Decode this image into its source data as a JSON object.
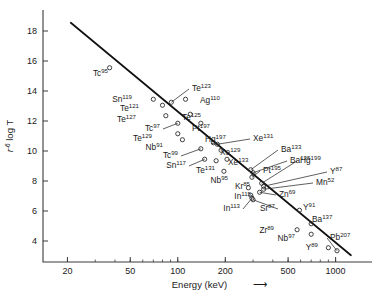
{
  "chart_data": {
    "type": "scatter",
    "title": "",
    "xlabel": "Energy (keV)",
    "xlabel_suffix": "⟶",
    "ylabel": "r",
    "ylabel_sup": "-6",
    "ylabel_rest": " log T",
    "xscale": "log",
    "yscale": "linear",
    "xlim": [
      14,
      1700
    ],
    "ylim": [
      2.6,
      19.4
    ],
    "grid": false,
    "legend": "none",
    "xticks": [
      20,
      50,
      100,
      200,
      500,
      1000
    ],
    "xticklabels": [
      "20",
      "50",
      "100",
      "200",
      "500",
      "1000"
    ],
    "yticks": [
      4,
      6,
      8,
      10,
      12,
      14,
      16,
      18
    ],
    "yticklabels": [
      "4",
      "6",
      "8",
      "10",
      "12",
      "14",
      "16",
      "18"
    ],
    "trendline": {
      "x": [
        21,
        1250
      ],
      "y": [
        18.55,
        3.05
      ]
    },
    "marker": "open-circle",
    "points": [
      {
        "element": "Tc",
        "mass": "95",
        "x": 37,
        "y": 15.55,
        "lx": 108,
        "ly": 76,
        "anchor": "end",
        "leader": false
      },
      {
        "element": "Sn",
        "mass": "119",
        "x": 70,
        "y": 13.45,
        "lx": 132,
        "ly": 102,
        "anchor": "end",
        "leader": false
      },
      {
        "element": "Te",
        "mass": "121",
        "x": 80,
        "y": 13.05,
        "lx": 139,
        "ly": 111,
        "anchor": "end",
        "leader": false
      },
      {
        "element": "Te",
        "mass": "123",
        "x": 91,
        "y": 13.25,
        "lx": 192,
        "ly": 91,
        "anchor": "start",
        "leader": true
      },
      {
        "element": "Ag",
        "mass": "110",
        "x": 112,
        "y": 13.45,
        "lx": 200,
        "ly": 103,
        "anchor": "start",
        "leader": false
      },
      {
        "element": "Te",
        "mass": "127",
        "x": 84,
        "y": 12.35,
        "lx": 136,
        "ly": 122,
        "anchor": "end",
        "leader": false
      },
      {
        "element": "Te",
        "mass": "125",
        "x": 120,
        "y": 12.45,
        "lx": 182,
        "ly": 120,
        "anchor": "start",
        "leader": false
      },
      {
        "element": "Tc",
        "mass": "97",
        "x": 100,
        "y": 11.85,
        "lx": 160,
        "ly": 131,
        "anchor": "end",
        "leader": true
      },
      {
        "element": "Pt",
        "mass": "197",
        "x": 140,
        "y": 11.85,
        "lx": 192,
        "ly": 131,
        "anchor": "start",
        "leader": false
      },
      {
        "element": "Te",
        "mass": "129",
        "x": 100,
        "y": 11.15,
        "lx": 152,
        "ly": 141,
        "anchor": "end",
        "leader": false
      },
      {
        "element": "Nb",
        "mass": "91",
        "x": 107,
        "y": 10.75,
        "lx": 163,
        "ly": 150,
        "anchor": "end",
        "leader": false
      },
      {
        "element": "Hg",
        "mass": "197",
        "x": 168,
        "y": 10.55,
        "lx": 205,
        "ly": 142,
        "anchor": "start",
        "leader": false
      },
      {
        "element": "Xe",
        "mass": "131",
        "x": 178,
        "y": 10.45,
        "lx": 253,
        "ly": 141,
        "anchor": "start",
        "leader": true
      },
      {
        "element": "Tc",
        "mass": "99",
        "x": 140,
        "y": 10.15,
        "lx": 178,
        "ly": 158,
        "anchor": "end",
        "leader": true
      },
      {
        "element": "Xe",
        "mass": "129",
        "x": 188,
        "y": 10.05,
        "lx": 220,
        "ly": 155,
        "anchor": "start",
        "leader": false
      },
      {
        "element": "Sn",
        "mass": "117",
        "x": 148,
        "y": 9.45,
        "lx": 186,
        "ly": 168,
        "anchor": "end",
        "leader": true
      },
      {
        "element": "Xe",
        "mass": "133",
        "x": 205,
        "y": 9.45,
        "lx": 228,
        "ly": 165,
        "anchor": "start",
        "leader": false
      },
      {
        "element": "Te",
        "mass": "131",
        "x": 175,
        "y": 9.35,
        "lx": 215,
        "ly": 173,
        "anchor": "end",
        "leader": false
      },
      {
        "element": "Ba",
        "mass": "133",
        "x": 290,
        "y": 8.75,
        "lx": 281,
        "ly": 152,
        "anchor": "start",
        "leader": true
      },
      {
        "element": "Ba",
        "mass": "135",
        "x": 300,
        "y": 8.55,
        "lx": 290,
        "ly": 163,
        "anchor": "start",
        "leader": true
      },
      {
        "element": "Nb",
        "mass": "95",
        "x": 196,
        "y": 8.65,
        "lx": 228,
        "ly": 183,
        "anchor": "end",
        "leader": false
      },
      {
        "element": "Pt",
        "mass": "195",
        "x": 295,
        "y": 8.25,
        "lx": 263,
        "ly": 173,
        "anchor": "start",
        "leader": true
      },
      {
        "element": "Hg",
        "mass": "199",
        "x": 340,
        "y": 7.85,
        "lx": 300,
        "ly": 163,
        "anchor": "start",
        "leader": true
      },
      {
        "element": "Y",
        "mass": "87",
        "x": 350,
        "y": 7.65,
        "lx": 330,
        "ly": 174,
        "anchor": "start",
        "leader": true
      },
      {
        "element": "Mn",
        "mass": "52",
        "x": 350,
        "y": 7.45,
        "lx": 316,
        "ly": 185,
        "anchor": "start",
        "leader": true
      },
      {
        "element": "Kr",
        "mass": "85",
        "x": 280,
        "y": 7.55,
        "lx": 250,
        "ly": 189,
        "anchor": "end",
        "leader": false
      },
      {
        "element": "Zn",
        "mass": "69",
        "x": 330,
        "y": 7.25,
        "lx": 279,
        "ly": 197,
        "anchor": "start",
        "leader": true
      },
      {
        "element": "In",
        "mass": "115",
        "x": 290,
        "y": 7.05,
        "lx": 251,
        "ly": 199,
        "anchor": "end",
        "leader": true
      },
      {
        "element": "In",
        "mass": "113",
        "x": 295,
        "y": 6.85,
        "lx": 240,
        "ly": 211,
        "anchor": "end",
        "leader": true
      },
      {
        "element": "Sr",
        "mass": "87",
        "x": 300,
        "y": 6.75,
        "lx": 275,
        "ly": 211,
        "anchor": "end",
        "leader": true
      },
      {
        "element": "Y",
        "mass": "91",
        "x": 590,
        "y": 6.05,
        "lx": 303,
        "ly": 210,
        "anchor": "start",
        "leader": false
      },
      {
        "element": "Ba",
        "mass": "137",
        "x": 700,
        "y": 5.15,
        "lx": 312,
        "ly": 222,
        "anchor": "start",
        "leader": true
      },
      {
        "element": "Zr",
        "mass": "89",
        "x": 570,
        "y": 4.75,
        "lx": 274,
        "ly": 233,
        "anchor": "end",
        "leader": false
      },
      {
        "element": "Nb",
        "mass": "97",
        "x": 700,
        "y": 4.45,
        "lx": 295,
        "ly": 241,
        "anchor": "end",
        "leader": false
      },
      {
        "element": "Y",
        "mass": "89",
        "x": 900,
        "y": 3.55,
        "lx": 318,
        "ly": 250,
        "anchor": "end",
        "leader": false
      },
      {
        "element": "Pb",
        "mass": "207",
        "x": 1020,
        "y": 3.35,
        "lx": 330,
        "ly": 240,
        "anchor": "start",
        "leader": true
      }
    ]
  }
}
